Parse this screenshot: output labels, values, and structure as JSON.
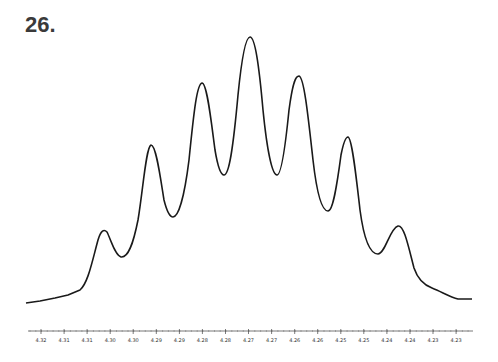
{
  "figure": {
    "label": "26."
  },
  "chart_data": {
    "type": "line",
    "title": "26.",
    "xlabel": "",
    "ylabel": "",
    "x_tick_labels": [
      "4.32",
      "4.31",
      "4.31",
      "4.30",
      "4.30",
      "4.29",
      "4.29",
      "4.28",
      "4.28",
      "4.27",
      "4.27",
      "4.26",
      "4.26",
      "4.25",
      "4.25",
      "4.24",
      "4.24",
      "4.23",
      "4.23"
    ],
    "xlim": [
      4.325,
      4.222
    ],
    "x_reversed": true,
    "grid": false,
    "legend": null,
    "peaks": [
      {
        "ppm": 4.302,
        "relative_height": 0.27
      },
      {
        "ppm": 4.291,
        "relative_height": 0.58
      },
      {
        "ppm": 4.28,
        "relative_height": 0.82
      },
      {
        "ppm": 4.27,
        "relative_height": 1.0
      },
      {
        "ppm": 4.26,
        "relative_height": 0.85
      },
      {
        "ppm": 4.249,
        "relative_height": 0.62
      },
      {
        "ppm": 4.238,
        "relative_height": 0.28
      }
    ],
    "valleys": [
      {
        "ppm": 4.297,
        "relative_height": 0.17
      },
      {
        "ppm": 4.286,
        "relative_height": 0.32
      },
      {
        "ppm": 4.275,
        "relative_height": 0.49
      },
      {
        "ppm": 4.264,
        "relative_height": 0.49
      },
      {
        "ppm": 4.254,
        "relative_height": 0.34
      },
      {
        "ppm": 4.243,
        "relative_height": 0.17
      }
    ],
    "baseline_relative": 0.0
  }
}
